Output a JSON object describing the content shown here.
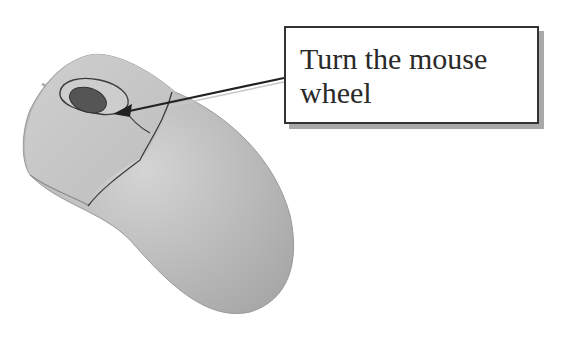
{
  "callout": {
    "text": "Turn the mouse wheel"
  },
  "illustration": {
    "subject": "computer mouse",
    "highlighted_part": "scroll wheel",
    "colors": {
      "body": "#c8c8c8",
      "body_shadow": "#a9a9a9",
      "wheel": "#555555",
      "outline": "#3a3a3a",
      "callout_border": "#333333",
      "callout_shadow": "#a8a8a8"
    }
  }
}
